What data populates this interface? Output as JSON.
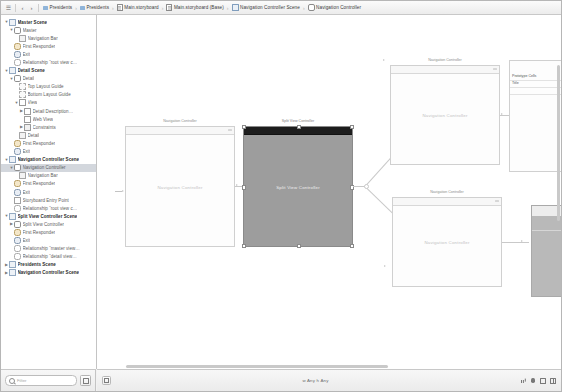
{
  "window": {
    "title": "Main.storyboard — Interface Builder"
  },
  "jumpbar": {
    "back_label": "‹",
    "forward_label": "›",
    "grid_label": "☰",
    "crumbs": [
      {
        "label": "Presidents",
        "icon": "folder-icon"
      },
      {
        "label": "Presidents",
        "icon": "group-folder-icon"
      },
      {
        "label": "Main.storyboard",
        "icon": "storyboard-file-icon"
      },
      {
        "label": "Main.storyboard (Base)",
        "icon": "storyboard-file-icon"
      },
      {
        "label": "Navigation Controller Scene",
        "icon": "scene-icon"
      },
      {
        "label": "Navigation Controller",
        "icon": "view-controller-icon"
      }
    ]
  },
  "outline": {
    "filter": {
      "placeholder": "Filter",
      "value": ""
    },
    "rows": [
      {
        "label": "Master Scene",
        "depth": 0,
        "twisty": "▼",
        "icon": "scene-icon",
        "bold": true,
        "selected": false
      },
      {
        "label": "Master",
        "depth": 1,
        "twisty": "▼",
        "icon": "view-controller-icon",
        "bold": false,
        "selected": false
      },
      {
        "label": "Navigation Bar",
        "depth": 2,
        "twisty": "",
        "icon": "nav-bar-icon",
        "bold": false,
        "selected": false
      },
      {
        "label": "First Responder",
        "depth": 1,
        "twisty": "",
        "icon": "first-responder-icon",
        "bold": false,
        "selected": false
      },
      {
        "label": "Exit",
        "depth": 1,
        "twisty": "",
        "icon": "exit-icon",
        "bold": false,
        "selected": false
      },
      {
        "label": "Relationship “root view c…",
        "depth": 1,
        "twisty": "",
        "icon": "relationship-icon",
        "bold": false,
        "selected": false
      },
      {
        "label": "Detail Scene",
        "depth": 0,
        "twisty": "▼",
        "icon": "scene-icon",
        "bold": true,
        "selected": false
      },
      {
        "label": "Detail",
        "depth": 1,
        "twisty": "▼",
        "icon": "view-controller-icon",
        "bold": false,
        "selected": false
      },
      {
        "label": "Top Layout Guide",
        "depth": 2,
        "twisty": "",
        "icon": "layout-guide-icon",
        "bold": false,
        "selected": false
      },
      {
        "label": "Bottom Layout Guide",
        "depth": 2,
        "twisty": "",
        "icon": "layout-guide-icon",
        "bold": false,
        "selected": false
      },
      {
        "label": "View",
        "depth": 2,
        "twisty": "▼",
        "icon": "view-icon",
        "bold": false,
        "selected": false
      },
      {
        "label": "Detail Description…",
        "depth": 3,
        "twisty": "▶",
        "icon": "label-icon",
        "bold": false,
        "selected": false
      },
      {
        "label": "Web View",
        "depth": 3,
        "twisty": "",
        "icon": "web-view-icon",
        "bold": false,
        "selected": false
      },
      {
        "label": "Constraints",
        "depth": 3,
        "twisty": "▶",
        "icon": "constraints-icon",
        "bold": false,
        "selected": false
      },
      {
        "label": "Detail",
        "depth": 2,
        "twisty": "",
        "icon": "nav-item-icon",
        "bold": false,
        "selected": false
      },
      {
        "label": "First Responder",
        "depth": 1,
        "twisty": "",
        "icon": "first-responder-icon",
        "bold": false,
        "selected": false
      },
      {
        "label": "Exit",
        "depth": 1,
        "twisty": "",
        "icon": "exit-icon",
        "bold": false,
        "selected": false
      },
      {
        "label": "Navigation Controller Scene",
        "depth": 0,
        "twisty": "▼",
        "icon": "scene-icon",
        "bold": true,
        "selected": false
      },
      {
        "label": "Navigation Controller",
        "depth": 1,
        "twisty": "▼",
        "icon": "view-controller-icon",
        "bold": false,
        "selected": true
      },
      {
        "label": "Navigation Bar",
        "depth": 2,
        "twisty": "",
        "icon": "nav-bar-icon",
        "bold": false,
        "selected": false
      },
      {
        "label": "First Responder",
        "depth": 1,
        "twisty": "",
        "icon": "first-responder-icon",
        "bold": false,
        "selected": false
      },
      {
        "label": "Exit",
        "depth": 1,
        "twisty": "",
        "icon": "exit-icon",
        "bold": false,
        "selected": false
      },
      {
        "label": "Storyboard Entry Point",
        "depth": 1,
        "twisty": "",
        "icon": "entry-point-icon",
        "bold": false,
        "selected": false
      },
      {
        "label": "Relationship “root view c…",
        "depth": 1,
        "twisty": "",
        "icon": "relationship-icon",
        "bold": false,
        "selected": false
      },
      {
        "label": "Split View Controller Scene",
        "depth": 0,
        "twisty": "▼",
        "icon": "scene-icon",
        "bold": true,
        "selected": false
      },
      {
        "label": "Split View Controller",
        "depth": 1,
        "twisty": "▶",
        "icon": "view-controller-icon",
        "bold": false,
        "selected": false
      },
      {
        "label": "First Responder",
        "depth": 1,
        "twisty": "",
        "icon": "first-responder-icon",
        "bold": false,
        "selected": false
      },
      {
        "label": "Exit",
        "depth": 1,
        "twisty": "",
        "icon": "exit-icon",
        "bold": false,
        "selected": false
      },
      {
        "label": "Relationship “master view…",
        "depth": 1,
        "twisty": "",
        "icon": "relationship-icon",
        "bold": false,
        "selected": false
      },
      {
        "label": "Relationship “detail view…",
        "depth": 1,
        "twisty": "",
        "icon": "relationship-icon",
        "bold": false,
        "selected": false
      },
      {
        "label": "Presidents Scene",
        "depth": 0,
        "twisty": "▶",
        "icon": "scene-icon",
        "bold": true,
        "selected": false
      },
      {
        "label": "Navigation Controller Scene",
        "depth": 0,
        "twisty": "▶",
        "icon": "scene-icon",
        "bold": true,
        "selected": false
      }
    ]
  },
  "canvas": {
    "scenes": [
      {
        "title": "Navigation Controller",
        "body": "Navigation Controller"
      },
      {
        "title": "Split View Controller",
        "body": "Split View Controller"
      },
      {
        "title": "Navigation Controller",
        "body": "Navigation Controller"
      },
      {
        "title": "Navigation Controller",
        "body": "Navigation Controller"
      },
      {
        "title": "Presidents",
        "body": ""
      }
    ],
    "table_cells": [
      "Prototype Cells",
      "Title"
    ]
  },
  "bottombar": {
    "size_class": "w Any h Any",
    "zoom_out": "−",
    "zoom_in": "+",
    "tools": [
      {
        "name": "align-icon"
      },
      {
        "name": "pin-icon"
      },
      {
        "name": "resolve-issues-icon"
      },
      {
        "name": "stack-view-icon"
      }
    ]
  }
}
